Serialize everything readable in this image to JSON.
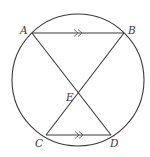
{
  "diagram": {
    "type": "geometry",
    "circle": {
      "cx": 78,
      "cy": 80,
      "r": 66
    },
    "points": [
      {
        "id": "A",
        "label": "A",
        "x": 32,
        "y": 33,
        "lx": 20,
        "ly": 34
      },
      {
        "id": "B",
        "label": "B",
        "x": 124,
        "y": 33,
        "lx": 128,
        "ly": 34
      },
      {
        "id": "C",
        "label": "C",
        "x": 46,
        "y": 135,
        "lx": 35,
        "ly": 147
      },
      {
        "id": "D",
        "label": "D",
        "x": 111,
        "y": 135,
        "lx": 110,
        "ly": 147
      },
      {
        "id": "E",
        "label": "E",
        "x": 78,
        "y": 94,
        "lx": 66,
        "ly": 101
      }
    ],
    "segments": [
      {
        "from": "A",
        "to": "B",
        "parallel_mark": "double-arrow"
      },
      {
        "from": "C",
        "to": "D",
        "parallel_mark": "double-arrow"
      },
      {
        "from": "A",
        "to": "D"
      },
      {
        "from": "B",
        "to": "C"
      }
    ],
    "colors": {
      "stroke": "#3a3a3a",
      "background": "#ffffff"
    }
  }
}
